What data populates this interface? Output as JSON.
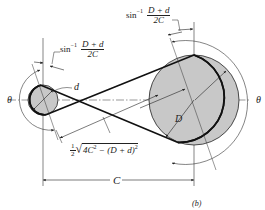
{
  "figure": {
    "label": "(b)"
  },
  "labels": {
    "theta_left": "θ",
    "theta_right": "θ",
    "small_diameter": "d",
    "large_diameter": "D",
    "center_distance": "C",
    "angle_left": {
      "prefix": "sin",
      "exponent": "−1",
      "numerator": "D + d",
      "denominator": "2C"
    },
    "angle_right": {
      "prefix": "sin",
      "exponent": "−1",
      "numerator": "D + d",
      "denominator": "2C"
    },
    "span_length": {
      "coef_num": "1",
      "coef_den": "2",
      "radicand_a": "4C",
      "radicand_a_exp": "2",
      "radicand_b": " − (D + d)",
      "radicand_b_exp": "2"
    }
  },
  "colors": {
    "pulley_fill": "#c8c8c8",
    "line": "#222222",
    "belt": "#111111"
  }
}
